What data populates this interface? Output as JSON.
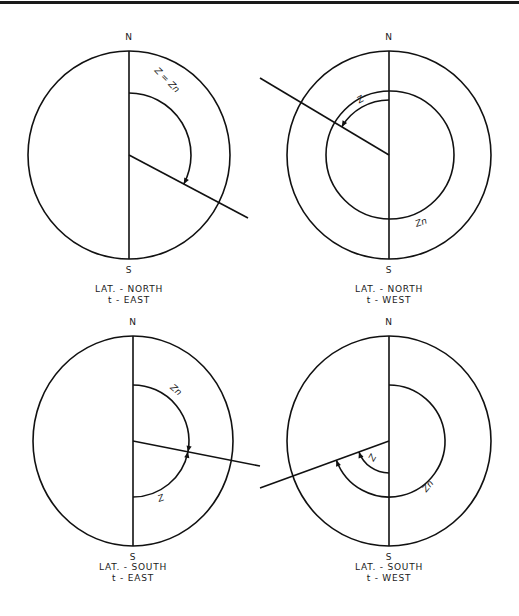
{
  "figure": {
    "panels": [
      {
        "id": "lat-north-t-east",
        "center": [
          129,
          155
        ],
        "rx": 101,
        "ry": 104,
        "north_label": "N",
        "south_label": "S",
        "caption": [
          "LAT. - NORTH",
          "t - EAST"
        ],
        "caption_y": [
          292,
          303
        ],
        "spoke_end": [
          248,
          218
        ],
        "arcs": [
          {
            "name": "z-equals-zn-arc",
            "label": "Z = Zn",
            "r": 62,
            "from_deg": 0,
            "to_deg": 118,
            "label_pos": [
              165,
              82
            ],
            "label_rot": 45
          }
        ],
        "inner_circle": null
      },
      {
        "id": "lat-north-t-west",
        "center": [
          389,
          155
        ],
        "rx": 102,
        "ry": 104,
        "north_label": "N",
        "south_label": "S",
        "caption": [
          "LAT. - NORTH",
          "t - WEST"
        ],
        "caption_y": [
          292,
          303
        ],
        "spoke_end": [
          260,
          78
        ],
        "arcs": [
          {
            "name": "z-arc",
            "label": "Z",
            "r": 55,
            "from_deg": 0,
            "to_deg": -58,
            "label_pos": [
              362,
              102
            ],
            "label_rot": -30
          }
        ],
        "inner_circle": {
          "name": "zn-circle",
          "label": "Zn",
          "r": 64,
          "label_pos": [
            422,
            225
          ],
          "label_rot": -20
        }
      },
      {
        "id": "lat-south-t-east",
        "center": [
          133,
          441
        ],
        "rx": 100,
        "ry": 105,
        "north_label": "N",
        "south_label": "S",
        "caption": [
          "LAT. - SOUTH",
          "t - EAST"
        ],
        "caption_y": [
          570,
          581
        ],
        "spoke_end": [
          260,
          466
        ],
        "arcs": [
          {
            "name": "zn-arc",
            "label": "Zn",
            "r": 56,
            "from_deg": 0,
            "to_deg": 98,
            "label_pos": [
              174,
              392
            ],
            "label_rot": 40
          },
          {
            "name": "z-arc",
            "label": "Z",
            "r": 56,
            "from_deg": 180,
            "to_deg": 102,
            "label_pos": [
              162,
              501
            ],
            "label_rot": -20
          }
        ],
        "inner_circle": null
      },
      {
        "id": "lat-south-t-west",
        "center": [
          389,
          441
        ],
        "rx": 102,
        "ry": 105,
        "north_label": "N",
        "south_label": "S",
        "caption": [
          "LAT. - SOUTH",
          "t - WEST"
        ],
        "caption_y": [
          570,
          581
        ],
        "spoke_end": [
          260,
          488
        ],
        "arcs": [
          {
            "name": "z-arc",
            "label": "Z",
            "r": 32,
            "from_deg": 180,
            "to_deg": 250,
            "label_pos": [
              375,
              459
            ],
            "label_rot": -60
          },
          {
            "name": "zn-arc",
            "label": "Zn",
            "r": 56,
            "from_deg": 0,
            "to_deg": 250,
            "label_pos": [
              430,
              488
            ],
            "label_rot": -50
          }
        ],
        "inner_circle": null
      }
    ]
  }
}
